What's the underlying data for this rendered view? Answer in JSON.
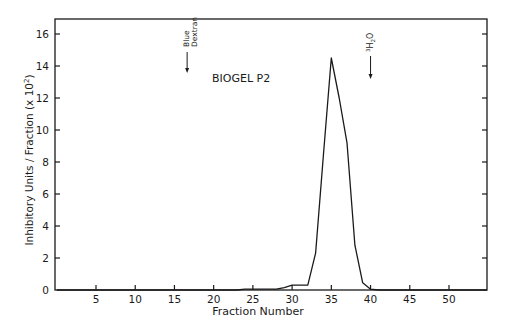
{
  "chart_data": {
    "type": "line",
    "title": "",
    "annotation": "BIOGEL P2",
    "xlabel": "Fraction Number",
    "ylabel": "Inhibitory Units / Fraction (x 10^2)",
    "ylabel_parts": {
      "main": "Inhibitory Units / Fraction (x 10",
      "sup": "2",
      "end": ")"
    },
    "xlim": [
      0,
      55
    ],
    "ylim": [
      0,
      17
    ],
    "xticks": [
      5,
      10,
      15,
      20,
      25,
      30,
      35,
      40,
      45,
      50
    ],
    "yticks": [
      0,
      2,
      4,
      6,
      8,
      10,
      12,
      14,
      16
    ],
    "grid": false,
    "legend": null,
    "markers": [
      {
        "label_line1": "Blue",
        "label_line2": "Dextran",
        "x": 17
      },
      {
        "label": "3H2O",
        "label_sup": "3",
        "label_main": "H",
        "label_sub": "2",
        "label_end": "O",
        "x": 40
      }
    ],
    "series": [
      {
        "name": "Inhibitory activity",
        "x": [
          0,
          5,
          10,
          15,
          20,
          23,
          24,
          25,
          26,
          27,
          28,
          29,
          30,
          31,
          32,
          33,
          34,
          35,
          36,
          37,
          38,
          39,
          40,
          41,
          45,
          50,
          55
        ],
        "y": [
          0,
          0,
          0,
          0,
          0,
          0,
          0.05,
          0.05,
          0.05,
          0.05,
          0.05,
          0.15,
          0.3,
          0.3,
          0.3,
          2.3,
          8.5,
          14.5,
          12.0,
          9.2,
          2.8,
          0.45,
          0.05,
          0,
          0,
          0,
          0
        ]
      }
    ]
  }
}
